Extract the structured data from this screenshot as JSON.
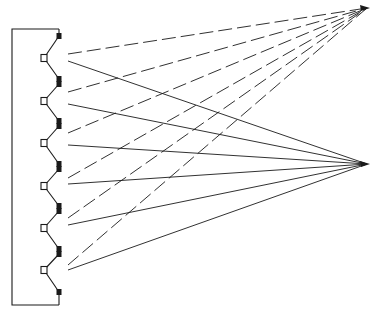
{
  "diagram": {
    "type": "ray-diagram",
    "frame": {
      "x1": 12,
      "y1": 29,
      "x2": 60,
      "y2": 305
    },
    "colors": {
      "line": "#1a1a1a",
      "background": "#ffffff"
    },
    "focal_points": [
      {
        "name": "upper-focus",
        "x": 367,
        "y": 8
      },
      {
        "name": "lower-focus",
        "x": 367,
        "y": 164
      }
    ],
    "elements": [
      {
        "square": {
          "x": 44,
          "y": 58
        },
        "top": 36,
        "bottom": 79,
        "dashed_start": {
          "x": 68,
          "y": 54
        },
        "solid_start": {
          "x": 68,
          "y": 61
        }
      },
      {
        "square": {
          "x": 44,
          "y": 101
        },
        "top": 84,
        "bottom": 121,
        "dashed_start": {
          "x": 68,
          "y": 92
        },
        "solid_start": {
          "x": 68,
          "y": 104
        }
      },
      {
        "square": {
          "x": 44,
          "y": 143
        },
        "top": 126,
        "bottom": 164,
        "dashed_start": {
          "x": 68,
          "y": 133
        },
        "solid_start": {
          "x": 68,
          "y": 145
        }
      },
      {
        "square": {
          "x": 44,
          "y": 186
        },
        "top": 169,
        "bottom": 206,
        "dashed_start": {
          "x": 68,
          "y": 178
        },
        "solid_start": {
          "x": 68,
          "y": 184
        }
      },
      {
        "square": {
          "x": 44,
          "y": 228
        },
        "top": 211,
        "bottom": 249,
        "dashed_start": {
          "x": 68,
          "y": 218
        },
        "solid_start": {
          "x": 68,
          "y": 225
        }
      },
      {
        "square": {
          "x": 44,
          "y": 270
        },
        "top": 254,
        "bottom": 292,
        "dashed_start": {
          "x": 68,
          "y": 265
        },
        "solid_start": {
          "x": 68,
          "y": 270
        }
      }
    ]
  }
}
